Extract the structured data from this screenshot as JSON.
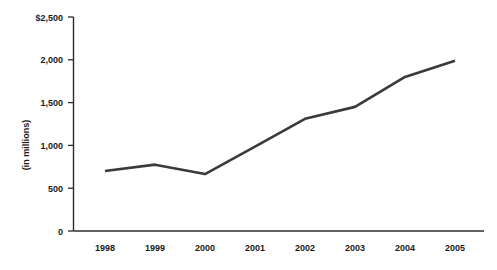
{
  "chart_data": {
    "type": "line",
    "title": "",
    "subtitle": "",
    "xlabel": "",
    "ylabel": "(in millions)",
    "categories": [
      "1998",
      "1999",
      "2000",
      "2001",
      "2002",
      "2003",
      "2004",
      "2005"
    ],
    "x": [
      1998,
      1999,
      2000,
      2001,
      2002,
      2003,
      2004,
      2005
    ],
    "values": [
      700,
      775,
      665,
      985,
      1310,
      1450,
      1800,
      1990
    ],
    "series": [
      {
        "name": "",
        "values": [
          700,
          775,
          665,
          985,
          1310,
          1450,
          1800,
          1990
        ]
      }
    ],
    "ylim": [
      0,
      2500
    ],
    "ytick_values": [
      0,
      500,
      1000,
      1500,
      2000,
      2500
    ],
    "ytick_labels": [
      "0",
      "500",
      "1,000",
      "1,500",
      "2,000",
      "$2,500"
    ],
    "xtick_labels": [
      "1998",
      "1999",
      "2000",
      "2001",
      "2002",
      "2003",
      "2004",
      "2005"
    ],
    "grid": false,
    "legend": false,
    "legend_position": "none",
    "line_color": "#3a3a3a",
    "axis_color": "#2b2b2b",
    "background_color": "#ffffff",
    "markers": false,
    "annotations": []
  },
  "axes": {
    "y_axis_title": "(in millions)",
    "y_ticks": [
      {
        "label": "$2,500",
        "value": 2500
      },
      {
        "label": "2,000",
        "value": 2000
      },
      {
        "label": "1,500",
        "value": 1500
      },
      {
        "label": "1,000",
        "value": 1000
      },
      {
        "label": "500",
        "value": 500
      },
      {
        "label": "0",
        "value": 0
      }
    ],
    "x_ticks": [
      {
        "label": "1998"
      },
      {
        "label": "1999"
      },
      {
        "label": "2000"
      },
      {
        "label": "2001"
      },
      {
        "label": "2002"
      },
      {
        "label": "2003"
      },
      {
        "label": "2004"
      },
      {
        "label": "2005"
      }
    ]
  }
}
